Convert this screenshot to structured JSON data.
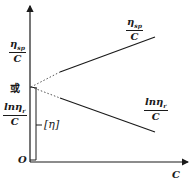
{
  "diagram": {
    "type": "intrinsic-viscosity-extrapolation",
    "axes": {
      "x_label": "C",
      "origin_label": "O"
    },
    "labels": {
      "left_upper_fraction": {
        "numerator": "η",
        "subscript": "sp",
        "denominator": "C"
      },
      "or_text": "或",
      "left_lower_fraction": {
        "numerator": "lnη",
        "subscript": "r",
        "denominator": "C"
      },
      "bracket_label": "[η]",
      "right_upper_fraction": {
        "numerator": "η",
        "subscript": "sp",
        "denominator": "C"
      },
      "right_lower_fraction": {
        "numerator": "lnη",
        "subscript": "r",
        "denominator": "C"
      }
    },
    "lines": [
      {
        "name": "eta-sp-over-c-line",
        "style": "solid",
        "from": [
          60,
          72
        ],
        "to": [
          155,
          37
        ]
      },
      {
        "name": "eta-sp-over-c-extrapolation",
        "style": "dotted",
        "from": [
          31,
          87
        ],
        "to": [
          60,
          72
        ]
      },
      {
        "name": "ln-eta-r-over-c-line",
        "style": "solid",
        "from": [
          60,
          98
        ],
        "to": [
          155,
          132
        ]
      },
      {
        "name": "ln-eta-r-over-c-extrapolation",
        "style": "dotted",
        "from": [
          31,
          87
        ],
        "to": [
          60,
          98
        ]
      }
    ],
    "colors": {
      "ink": "#1a1a1a",
      "background": "#ffffff"
    }
  }
}
